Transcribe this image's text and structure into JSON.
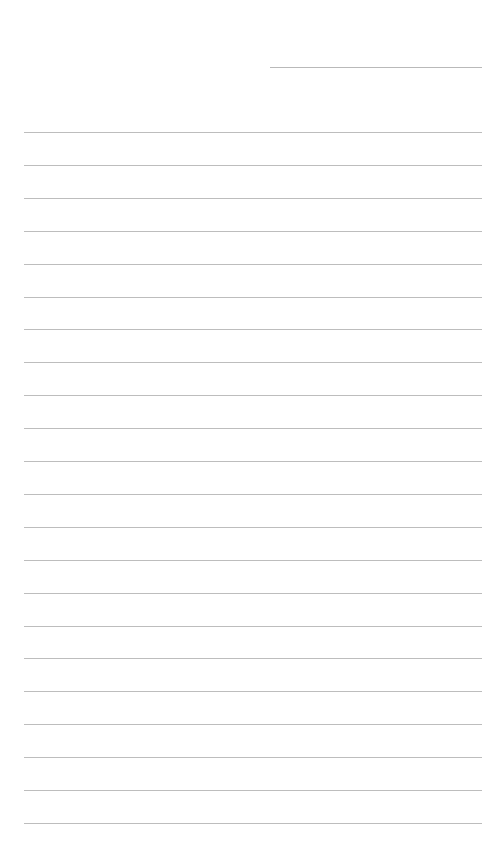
{
  "page": {
    "background": "#ffffff",
    "line_color": "#bdbdbd",
    "date_field": {
      "value": "",
      "x": 270,
      "y": 67,
      "width": 212
    },
    "ruled_lines": {
      "count": 22,
      "first_y": 132,
      "spacing": 32.9,
      "x": 24,
      "width": 458,
      "lines": [
        "",
        "",
        "",
        "",
        "",
        "",
        "",
        "",
        "",
        "",
        "",
        "",
        "",
        "",
        "",
        "",
        "",
        "",
        "",
        "",
        "",
        ""
      ]
    }
  }
}
